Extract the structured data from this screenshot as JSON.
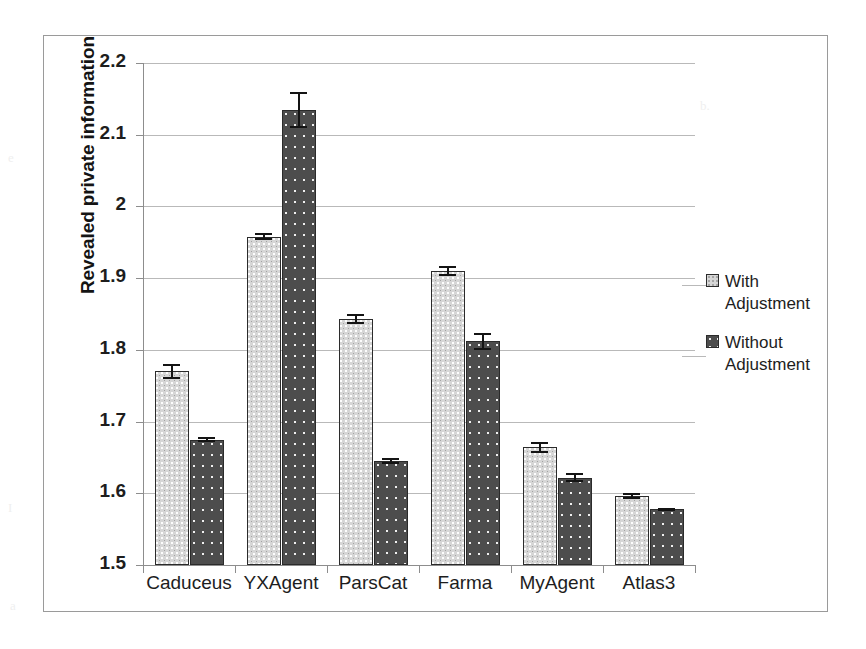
{
  "chart_data": {
    "type": "bar",
    "title": "",
    "xlabel": "",
    "ylabel": "Revealed private information",
    "categories": [
      "Caduceus",
      "YXAgent",
      "ParsCat",
      "Farma",
      "MyAgent",
      "Atlas3"
    ],
    "ylim": [
      1.5,
      2.2
    ],
    "ytick_step": 0.1,
    "yticks": [
      "1.5",
      "1.6",
      "1.7",
      "1.8",
      "1.9",
      "2",
      "2.1",
      "2.2"
    ],
    "grid": true,
    "legend_position": "right",
    "series": [
      {
        "name": "With Adjustment",
        "color": "#d6d6d6",
        "pattern": "fine-speckle",
        "values": [
          1.77,
          1.958,
          1.843,
          1.91,
          1.664,
          1.596
        ],
        "errors": [
          0.01,
          0.005,
          0.007,
          0.007,
          0.008,
          0.004
        ]
      },
      {
        "name": "Without Adjustment",
        "color": "#4d4d4d",
        "pattern": "white-dots",
        "values": [
          1.675,
          2.135,
          1.645,
          1.812,
          1.622,
          1.578
        ],
        "errors": [
          0.003,
          0.025,
          0.004,
          0.012,
          0.006,
          0.002
        ]
      }
    ]
  },
  "legend": {
    "items": [
      {
        "label_line1": "With",
        "label_line2": "Adjustment",
        "swatch": "light"
      },
      {
        "label_line1": "Without",
        "label_line2": "Adjustment",
        "swatch": "dark"
      }
    ]
  }
}
